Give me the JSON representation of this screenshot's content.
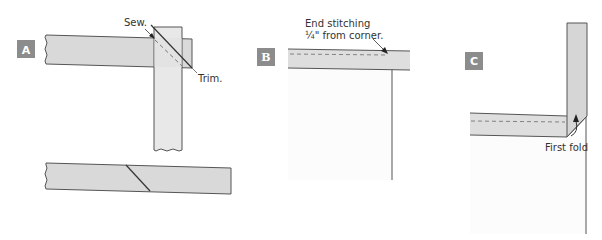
{
  "colors": {
    "strip_fill": "#d9d9d9",
    "strip_light": "#e4e4e4",
    "outline": "#555555",
    "badge": "#8c8c8c",
    "quilt_fill": "#fcfcfc",
    "stitch": "#888888"
  },
  "panels": [
    {
      "id": "A",
      "badge": "A",
      "labels": {
        "sew": "Sew.",
        "trim": "Trim."
      }
    },
    {
      "id": "B",
      "badge": "B",
      "labels": {
        "line1": "End stitching",
        "line2": "¼\" from corner."
      }
    },
    {
      "id": "C",
      "badge": "C",
      "labels": {
        "first_fold": "First fold"
      }
    }
  ]
}
